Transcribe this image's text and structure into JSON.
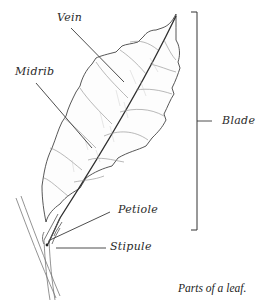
{
  "diagram": {
    "caption": "Parts of a leaf.",
    "labels": {
      "vein": "Vein",
      "midrib": "Midrib",
      "blade": "Blade",
      "petiole": "Petiole",
      "stipule": "Stipule"
    },
    "colors": {
      "background": "#ffffff",
      "ink": "#333333",
      "leader": "#3a3a3a",
      "fine_vein": "#9a9a9a"
    }
  }
}
